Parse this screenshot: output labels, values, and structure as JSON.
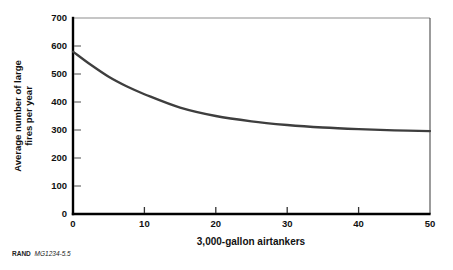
{
  "chart_data": {
    "type": "line",
    "title": "",
    "xlabel": "3,000-gallon airtankers",
    "ylabel": "Average number of large fires per year",
    "ylabel_lines": [
      "Average number of large",
      "fires per year"
    ],
    "xlim": [
      0,
      50
    ],
    "ylim": [
      0,
      700
    ],
    "xticks": [
      0,
      10,
      20,
      30,
      40,
      50
    ],
    "yticks": [
      0,
      100,
      200,
      300,
      400,
      500,
      600,
      700
    ],
    "grid": false,
    "legend": false,
    "series": [
      {
        "x": [
          0,
          2.5,
          5,
          7.5,
          10,
          15,
          20,
          25,
          30,
          35,
          40,
          45,
          50
        ],
        "y": [
          580,
          533,
          490,
          456,
          428,
          380,
          350,
          331,
          318,
          309,
          303,
          299,
          296
        ]
      }
    ],
    "colors": {
      "curve": "#3e3e3e",
      "axis": "#000000",
      "frame_top": "#8d8d8d",
      "frame_right": "#4a4a4a",
      "ytick_mark": "#757575",
      "xtick_mark": "#333333"
    }
  },
  "footer": {
    "brand": "RAND",
    "code": "MG1234-5.5"
  }
}
